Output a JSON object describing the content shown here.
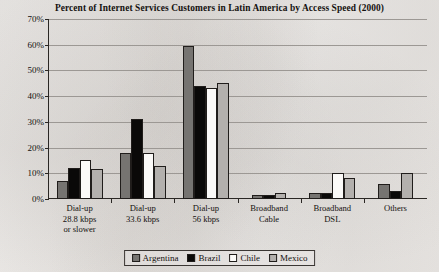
{
  "chart_data": {
    "type": "bar",
    "title": "Percent of Internet Services Customers in Latin America by Access Speed (2000)",
    "xlabel": "",
    "ylabel": "",
    "ylim": [
      0,
      70
    ],
    "ytick_labels": [
      "0%",
      "10%",
      "20%",
      "30%",
      "40%",
      "50%",
      "60%",
      "70%"
    ],
    "ytick_values": [
      0,
      10,
      20,
      30,
      40,
      50,
      60,
      70
    ],
    "grid": true,
    "legend_position": "bottom-center",
    "categories": [
      "Dial-up\n28.8 kbps\nor slower",
      "Dial-up\n33.6 kbps",
      "Dial-up\n56 kbps",
      "Broadband\nCable",
      "Broadband\nDSL",
      "Others"
    ],
    "category_lines": [
      [
        "Dial-up",
        "28.8 kbps",
        "or slower"
      ],
      [
        "Dial-up",
        "33.6 kbps",
        ""
      ],
      [
        "Dial-up",
        "56 kbps",
        ""
      ],
      [
        "Broadband",
        "Cable",
        ""
      ],
      [
        "Broadband",
        "DSL",
        ""
      ],
      [
        "Others",
        "",
        ""
      ]
    ],
    "series": [
      {
        "name": "Argentina",
        "color": "#767471",
        "values": [
          7,
          18,
          59.5,
          1.5,
          2.5,
          6
        ]
      },
      {
        "name": "Brazil",
        "color": "#0a0908",
        "values": [
          12,
          31,
          44,
          1.5,
          2.5,
          3
        ]
      },
      {
        "name": "Chile",
        "color": "#fbfaf8",
        "values": [
          15,
          18,
          43,
          0,
          10,
          0
        ]
      },
      {
        "name": "Mexico",
        "color": "#b3b0ad",
        "values": [
          11.5,
          13,
          45,
          2.5,
          8,
          10
        ]
      }
    ]
  },
  "legend": {
    "items": [
      {
        "label": "Argentina",
        "color": "#767471"
      },
      {
        "label": "Brazil",
        "color": "#0a0908"
      },
      {
        "label": "Chile",
        "color": "#fbfaf8"
      },
      {
        "label": "Mexico",
        "color": "#b3b0ad"
      }
    ]
  }
}
